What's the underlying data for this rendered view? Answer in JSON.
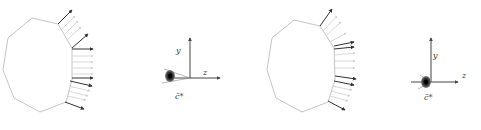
{
  "panels": [
    {
      "id": "panel-1",
      "polygon": [
        [
          32,
          18
        ],
        [
          58,
          24
        ],
        [
          72,
          48
        ],
        [
          72,
          80
        ],
        [
          66,
          102
        ],
        [
          40,
          112
        ],
        [
          14,
          98
        ],
        [
          3,
          70
        ],
        [
          8,
          38
        ]
      ],
      "arrows": [
        {
          "x1": 58,
          "y1": 24,
          "x2": 72,
          "y2": 10,
          "dark": true
        },
        {
          "x1": 61,
          "y1": 30,
          "x2": 75,
          "y2": 16,
          "dark": false
        },
        {
          "x1": 64,
          "y1": 35,
          "x2": 78,
          "y2": 21,
          "dark": false
        },
        {
          "x1": 67,
          "y1": 40,
          "x2": 81,
          "y2": 27,
          "dark": false
        },
        {
          "x1": 72,
          "y1": 48,
          "x2": 88,
          "y2": 34,
          "dark": true
        },
        {
          "x1": 72,
          "y1": 49,
          "x2": 93,
          "y2": 49,
          "dark": true
        },
        {
          "x1": 72,
          "y1": 56,
          "x2": 93,
          "y2": 56,
          "dark": false
        },
        {
          "x1": 72,
          "y1": 62,
          "x2": 93,
          "y2": 62,
          "dark": false
        },
        {
          "x1": 72,
          "y1": 68,
          "x2": 93,
          "y2": 68,
          "dark": false
        },
        {
          "x1": 72,
          "y1": 74,
          "x2": 93,
          "y2": 74,
          "dark": false
        },
        {
          "x1": 72,
          "y1": 78,
          "x2": 93,
          "y2": 78,
          "dark": true
        },
        {
          "x1": 70,
          "y1": 81,
          "x2": 92,
          "y2": 86,
          "dark": true
        },
        {
          "x1": 69,
          "y1": 86,
          "x2": 90,
          "y2": 91,
          "dark": false
        },
        {
          "x1": 68,
          "y1": 91,
          "x2": 88,
          "y2": 96,
          "dark": false
        },
        {
          "x1": 67,
          "y1": 96,
          "x2": 86,
          "y2": 100,
          "dark": false
        },
        {
          "x1": 65,
          "y1": 102,
          "x2": 84,
          "y2": 109,
          "dark": true
        }
      ],
      "axes": {
        "origin": [
          190,
          78
        ],
        "y_end": [
          190,
          38
        ],
        "z_end": [
          220,
          78
        ],
        "y_label": "y",
        "z_label": "z",
        "c_label": "c̄*",
        "y_label_pos": [
          176,
          47
        ],
        "z_label_pos": [
          203,
          69
        ],
        "c_label_pos": [
          175,
          93
        ],
        "blob": [
          170,
          76
        ]
      }
    },
    {
      "id": "panel-2",
      "polygon": [
        [
          294,
          20
        ],
        [
          320,
          26
        ],
        [
          334,
          48
        ],
        [
          335,
          80
        ],
        [
          328,
          102
        ],
        [
          302,
          112
        ],
        [
          276,
          98
        ],
        [
          267,
          70
        ],
        [
          272,
          38
        ]
      ],
      "arrows": [
        {
          "x1": 320,
          "y1": 26,
          "x2": 332,
          "y2": 9,
          "dark": true
        },
        {
          "x1": 323,
          "y1": 31,
          "x2": 337,
          "y2": 16,
          "dark": false
        },
        {
          "x1": 326,
          "y1": 36,
          "x2": 341,
          "y2": 22,
          "dark": false
        },
        {
          "x1": 330,
          "y1": 42,
          "x2": 346,
          "y2": 33,
          "dark": false
        },
        {
          "x1": 334,
          "y1": 46,
          "x2": 354,
          "y2": 42,
          "dark": true
        },
        {
          "x1": 334,
          "y1": 49,
          "x2": 354,
          "y2": 47,
          "dark": true
        },
        {
          "x1": 335,
          "y1": 55,
          "x2": 355,
          "y2": 53,
          "dark": false
        },
        {
          "x1": 335,
          "y1": 61,
          "x2": 355,
          "y2": 61,
          "dark": false
        },
        {
          "x1": 335,
          "y1": 68,
          "x2": 355,
          "y2": 68,
          "dark": false
        },
        {
          "x1": 335,
          "y1": 76,
          "x2": 356,
          "y2": 79,
          "dark": true
        },
        {
          "x1": 334,
          "y1": 81,
          "x2": 354,
          "y2": 85,
          "dark": true
        },
        {
          "x1": 332,
          "y1": 86,
          "x2": 352,
          "y2": 90,
          "dark": false
        },
        {
          "x1": 331,
          "y1": 91,
          "x2": 350,
          "y2": 96,
          "dark": false
        },
        {
          "x1": 330,
          "y1": 96,
          "x2": 348,
          "y2": 101,
          "dark": false
        },
        {
          "x1": 328,
          "y1": 101,
          "x2": 345,
          "y2": 110,
          "dark": true
        }
      ],
      "axes": {
        "origin": [
          431,
          82
        ],
        "y_end": [
          431,
          38
        ],
        "z_end": [
          458,
          82
        ],
        "y_label": "y",
        "z_label": "z",
        "c_label": "c̄*",
        "y_label_pos": [
          433,
          52
        ],
        "z_label_pos": [
          462,
          72
        ],
        "c_label_pos": [
          424,
          94
        ],
        "blob": [
          426,
          82
        ]
      }
    }
  ],
  "colors": {
    "polygon_stroke": "#bdbdbd",
    "arrow_dark": "#333333",
    "arrow_light": "#cfcfcf",
    "axis": "#444444",
    "blob": "#222222",
    "label": "#333333"
  }
}
